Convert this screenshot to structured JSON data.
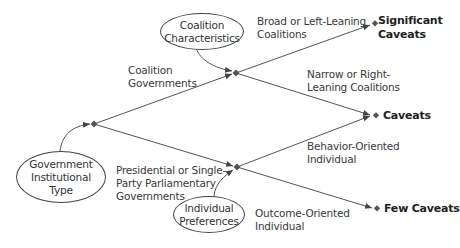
{
  "diagram": {
    "nodes": {
      "root": {
        "label_lines": [
          "Government",
          "Institutional",
          "Type"
        ]
      },
      "coalition_char": {
        "label_lines": [
          "Coalition",
          "Characteristics"
        ]
      },
      "individual_pref": {
        "label_lines": [
          "Individual",
          "Preferences"
        ]
      }
    },
    "branches": {
      "coalition": [
        "Coalition",
        "Governments"
      ],
      "presidential": [
        "Presidential or Single-",
        "Party Parliamentary",
        "Governments"
      ],
      "broad": [
        "Broad or Left-Leaning",
        "Coalitions"
      ],
      "narrow": [
        "Narrow or Right-",
        "Leaning Coalitions"
      ],
      "behavior": [
        "Behavior-Oriented",
        "Individual"
      ],
      "outcome": [
        "Outcome-Oriented",
        "Individual"
      ]
    },
    "outcomes": {
      "significant": [
        "Significant",
        "Caveats"
      ],
      "caveats": "Caveats",
      "few": "Few Caveats"
    },
    "colors": {
      "line": "#555555",
      "text": "#333333"
    }
  }
}
